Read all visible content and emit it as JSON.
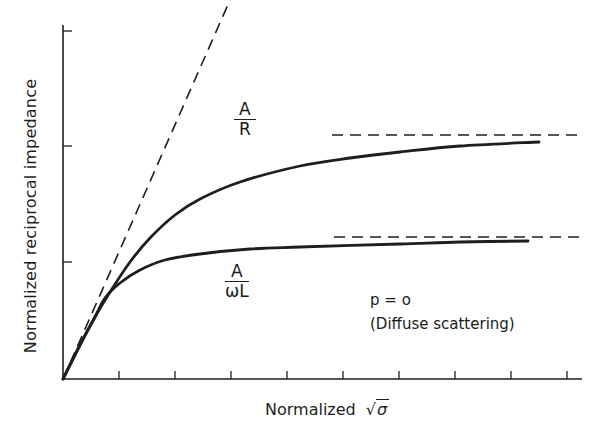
{
  "chart_data": {
    "type": "line",
    "title": "",
    "xlabel": "Normalized √σ",
    "ylabel": "Normalized reciprocal impedance",
    "xlabel_parts": {
      "text": "Normalized",
      "symbol": "σ"
    },
    "x_ticks": 9,
    "y_ticks": 3,
    "tick_labels": [],
    "grid": false,
    "legend": null,
    "annotation": {
      "line1": "p = o",
      "line2": "(Diffuse scattering)"
    },
    "series": [
      {
        "name": "A/R",
        "label_num": "A",
        "label_den": "R",
        "style": "solid",
        "points_px": [
          [
            63,
            379
          ],
          [
            80,
            345
          ],
          [
            95,
            317
          ],
          [
            110,
            292
          ],
          [
            130,
            262
          ],
          [
            150,
            238
          ],
          [
            175,
            215
          ],
          [
            200,
            199
          ],
          [
            240,
            182
          ],
          [
            300,
            166
          ],
          [
            350,
            158
          ],
          [
            400,
            152
          ],
          [
            460,
            146
          ],
          [
            539,
            142
          ]
        ]
      },
      {
        "name": "A/ωL",
        "label_num": "A",
        "label_den": "ωL",
        "style": "solid",
        "points_px": [
          [
            63,
            379
          ],
          [
            80,
            345
          ],
          [
            95,
            317
          ],
          [
            105,
            298
          ],
          [
            120,
            283
          ],
          [
            140,
            270
          ],
          [
            165,
            260
          ],
          [
            200,
            254
          ],
          [
            250,
            249
          ],
          [
            300,
            247
          ],
          [
            400,
            244
          ],
          [
            460,
            242
          ],
          [
            528,
            241
          ]
        ]
      },
      {
        "name": "Initial slope asymptote",
        "style": "dashed",
        "points_px": [
          [
            63,
            379
          ],
          [
            230,
            0
          ]
        ]
      },
      {
        "name": "A/R asymptote",
        "style": "dashed",
        "points_px": [
          [
            332,
            135
          ],
          [
            577,
            135
          ]
        ]
      },
      {
        "name": "A/ωL asymptote",
        "style": "dashed",
        "points_px": [
          [
            334,
            237
          ],
          [
            580,
            237
          ]
        ]
      }
    ],
    "axes_px": {
      "origin": [
        63,
        379
      ],
      "y_top": 25,
      "x_right": 582
    },
    "x_tick_px": [
      119,
      175,
      231,
      287,
      343,
      399,
      455,
      511,
      567
    ],
    "y_tick_px": [
      31,
      146,
      262
    ]
  },
  "labels": {
    "ylabel": "Normalized reciprocal impedance",
    "xlabel_text": "Normalized",
    "xlabel_symbol": "σ",
    "xlabel_radical": "√",
    "ar_num": "A",
    "ar_den": "R",
    "awl_num": "A",
    "awl_den": "ωL",
    "note_line1": "p = o",
    "note_line2": "(Diffuse scattering)"
  },
  "colors": {
    "ink": "#1e1e1e",
    "background": "#ffffff"
  }
}
